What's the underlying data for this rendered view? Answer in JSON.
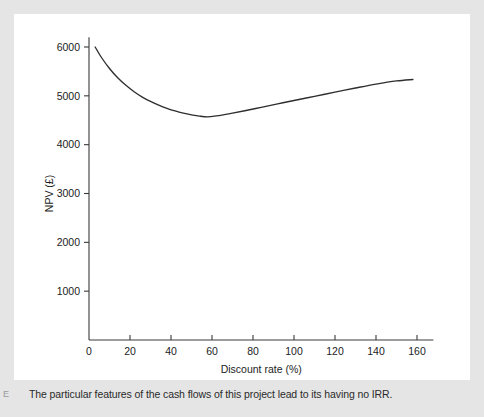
{
  "figure": {
    "caption": "The particular features of the cash flows of this project lead to its having no IRR.",
    "margin_mark": "E",
    "panel_color": "#ffffff",
    "background_color": "#e5e5e5",
    "line_color": "#2e2e2e"
  },
  "chart_data": {
    "type": "line",
    "title": "",
    "xlabel": "Discount rate (%)",
    "ylabel": "NPV (£)",
    "xlim": [
      0,
      168
    ],
    "ylim": [
      0,
      6200
    ],
    "xticks": [
      0,
      20,
      40,
      60,
      80,
      100,
      120,
      140,
      160
    ],
    "xticklabels": [
      "0",
      "20",
      "40",
      "60",
      "80",
      "100",
      "120",
      "140",
      "160"
    ],
    "yticks": [
      1000,
      2000,
      3000,
      4000,
      5000,
      6000
    ],
    "yticklabels": [
      "1000",
      "2000",
      "3000",
      "4000",
      "5000",
      "6000"
    ],
    "grid": false,
    "legend": false,
    "series": [
      {
        "name": "NPV",
        "x": [
          3,
          6,
          10,
          14,
          18,
          22,
          26,
          30,
          34,
          38,
          42,
          46,
          50,
          54,
          58,
          62,
          66,
          70,
          76,
          84,
          92,
          100,
          110,
          120,
          130,
          140,
          150,
          158
        ],
        "y": [
          6000,
          5790,
          5560,
          5370,
          5215,
          5085,
          4975,
          4885,
          4810,
          4745,
          4690,
          4645,
          4610,
          4583,
          4570,
          4588,
          4615,
          4645,
          4695,
          4765,
          4835,
          4905,
          4990,
          5075,
          5160,
          5240,
          5305,
          5335
        ]
      }
    ],
    "annotations": [
      {
        "text": "minimum NPV approx £4570 at discount rate approx 58%"
      },
      {
        "text": "curve never crosses zero — no IRR"
      }
    ]
  }
}
